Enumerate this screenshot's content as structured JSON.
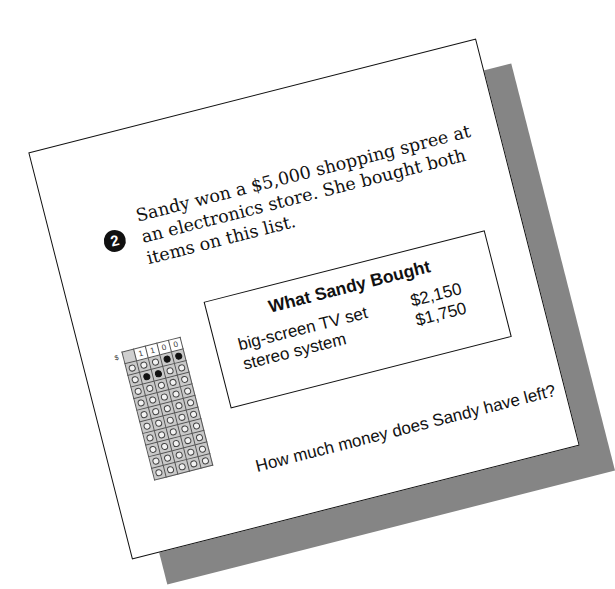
{
  "problem": {
    "number": "2",
    "prompt_lines": [
      "Sandy won a $5,000 shopping spree at",
      "an electronics store. She bought both",
      "items on this list."
    ],
    "question": "How much money does Sandy have left?"
  },
  "purchase_table": {
    "title": "What Sandy Bought",
    "rows": [
      {
        "item": "big-screen TV set",
        "price": "$2,150"
      },
      {
        "item": "stereo system",
        "price": "$1,750"
      }
    ]
  },
  "answer_grid": {
    "currency_symbol": "$",
    "written_answer": [
      "",
      "1",
      "1",
      "0",
      "0"
    ],
    "digits": [
      "0",
      "1",
      "2",
      "3",
      "4",
      "5",
      "6",
      "7",
      "8",
      "9"
    ],
    "filled": {
      "1": "1",
      "2": "1",
      "3": "0",
      "4": "0"
    }
  },
  "colors": {
    "shadow": "#858585",
    "ink": "#111111",
    "grid_fill": "#c9c9c9"
  }
}
